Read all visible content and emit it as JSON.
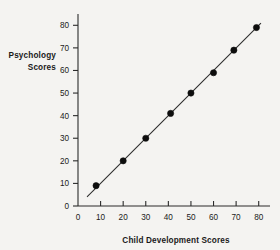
{
  "chart_data": {
    "type": "scatter",
    "title": "",
    "xlabel": "Child Development Scores",
    "ylabel_line1": "Psychology",
    "ylabel_line2": "Scores",
    "ylabel": "Psychology Scores",
    "xlim": [
      0,
      85
    ],
    "ylim": [
      0,
      85
    ],
    "xticks": [
      0,
      10,
      20,
      30,
      40,
      50,
      60,
      70,
      80
    ],
    "yticks": [
      0,
      10,
      20,
      30,
      40,
      50,
      60,
      70,
      80
    ],
    "xtick_labels": [
      "0",
      "10",
      "20",
      "30",
      "40",
      "50",
      "60",
      "70",
      "80"
    ],
    "ytick_labels": [
      "0",
      "10",
      "20",
      "30",
      "40",
      "50",
      "60",
      "70",
      "80"
    ],
    "grid": false,
    "legend": false,
    "marker_color": "#0d0d0d",
    "line_color": "#2b2b2b",
    "background_color": "#f4f3f1",
    "points": [
      {
        "x": 8,
        "y": 9
      },
      {
        "x": 20,
        "y": 20
      },
      {
        "x": 30,
        "y": 30
      },
      {
        "x": 41,
        "y": 41
      },
      {
        "x": 50,
        "y": 50
      },
      {
        "x": 60,
        "y": 59
      },
      {
        "x": 69,
        "y": 69
      },
      {
        "x": 79,
        "y": 79
      }
    ],
    "fit_line": {
      "x_start": 4,
      "y_start": 4,
      "x_end": 81,
      "y_end": 81
    }
  }
}
